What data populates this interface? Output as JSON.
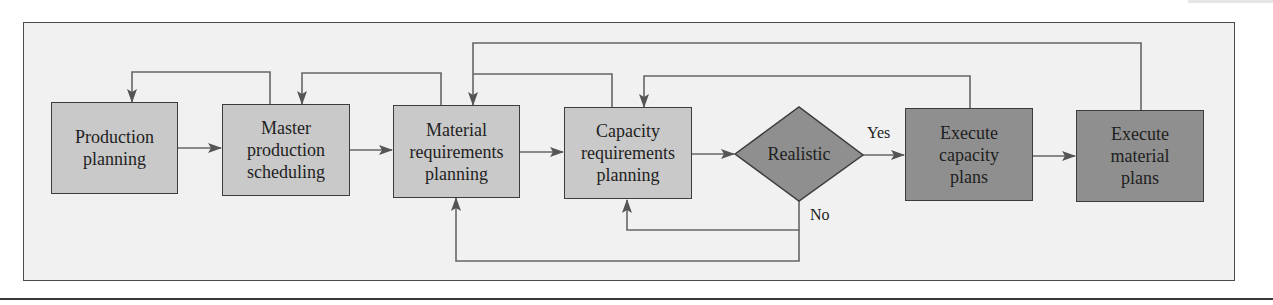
{
  "diagram": {
    "nodes": {
      "production_planning": {
        "label": "Production\nplanning",
        "shade": "light"
      },
      "master_production_scheduling": {
        "label": "Master\nproduction\nscheduling",
        "shade": "light"
      },
      "material_requirements_planning": {
        "label": "Material\nrequirements\nplanning",
        "shade": "light"
      },
      "capacity_requirements_planning": {
        "label": "Capacity\nrequirements\nplanning",
        "shade": "light"
      },
      "realistic_decision": {
        "label": "Realistic",
        "shape": "diamond",
        "shade": "dark"
      },
      "execute_capacity_plans": {
        "label": "Execute\ncapacity\nplans",
        "shade": "dark"
      },
      "execute_material_plans": {
        "label": "Execute\nmaterial\nplans",
        "shade": "dark"
      }
    },
    "edge_labels": {
      "yes": "Yes",
      "no": "No"
    },
    "edges": [
      {
        "from": "Production planning",
        "to": "Master production scheduling",
        "type": "forward"
      },
      {
        "from": "Master production scheduling",
        "to": "Material requirements planning",
        "type": "forward"
      },
      {
        "from": "Material requirements planning",
        "to": "Capacity requirements planning",
        "type": "forward"
      },
      {
        "from": "Capacity requirements planning",
        "to": "Realistic",
        "type": "forward"
      },
      {
        "from": "Realistic",
        "to": "Execute capacity plans",
        "label": "Yes",
        "type": "forward"
      },
      {
        "from": "Execute capacity plans",
        "to": "Execute material plans",
        "type": "forward"
      },
      {
        "from": "Master production scheduling",
        "to": "Production planning",
        "type": "feedback-top"
      },
      {
        "from": "Material requirements planning",
        "to": "Master production scheduling",
        "type": "feedback-top"
      },
      {
        "from": "Capacity requirements planning",
        "to": "Material requirements planning",
        "type": "feedback-top"
      },
      {
        "from": "Execute capacity plans",
        "to": "Capacity requirements planning",
        "type": "feedback-top"
      },
      {
        "from": "Execute material plans",
        "to": "Material requirements planning",
        "type": "feedback-top"
      },
      {
        "from": "Realistic",
        "to": "Capacity requirements planning",
        "label": "No",
        "type": "feedback-bottom"
      },
      {
        "from": "Realistic",
        "to": "Material requirements planning",
        "label": "No",
        "type": "feedback-bottom"
      }
    ],
    "colors": {
      "frame_bg": "#f1f1f1",
      "light_box": "#c9c9c9",
      "dark_box": "#8f8f8f",
      "line": "#666666"
    }
  }
}
